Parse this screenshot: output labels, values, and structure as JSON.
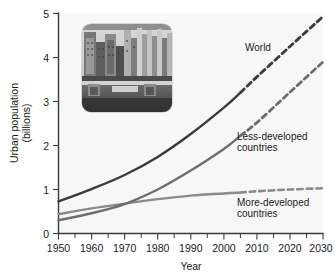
{
  "chart_data": {
    "type": "line",
    "title": "",
    "xlabel": "Year",
    "ylabel": "Urban population (billions)",
    "ylabel_line1": "Urban population",
    "ylabel_line2": "(billions)",
    "xlim": [
      1950,
      2030
    ],
    "ylim": [
      0,
      5
    ],
    "xticks": [
      1950,
      1960,
      1970,
      1980,
      1990,
      2000,
      2010,
      2020,
      2030
    ],
    "xtick_labels": [
      "1950",
      "1960",
      "1970",
      "1980",
      "1990",
      "2000",
      "2010",
      "2020",
      "2030"
    ],
    "xminor_step": 5,
    "yticks": [
      0,
      1,
      2,
      3,
      4,
      5
    ],
    "ytick_labels": [
      "0",
      "1",
      "2",
      "3",
      "4",
      "5"
    ],
    "grid": false,
    "legend_position": "inline-annotations",
    "projection_start_year": 2005,
    "series": [
      {
        "name": "World",
        "label": "World",
        "color": "#3b3b3b",
        "x": [
          1950,
          1960,
          1970,
          1980,
          1990,
          2000,
          2005,
          2010,
          2020,
          2030
        ],
        "values": [
          0.73,
          1.01,
          1.33,
          1.74,
          2.26,
          2.86,
          3.2,
          3.56,
          4.25,
          4.93
        ]
      },
      {
        "name": "Less-developed countries",
        "label_line1": "Less-developed",
        "label_line2": "countries",
        "color": "#6e6e6e",
        "x": [
          1950,
          1960,
          1970,
          1980,
          1990,
          2000,
          2005,
          2010,
          2020,
          2030
        ],
        "values": [
          0.3,
          0.46,
          0.67,
          1.0,
          1.43,
          1.92,
          2.22,
          2.52,
          3.21,
          3.9
        ]
      },
      {
        "name": "More-developed countries",
        "label_line1": "More-developed",
        "label_line2": "countries",
        "color": "#8a8a8a",
        "x": [
          1950,
          1960,
          1970,
          1980,
          1990,
          2000,
          2005,
          2010,
          2020,
          2030
        ],
        "values": [
          0.44,
          0.57,
          0.68,
          0.78,
          0.86,
          0.91,
          0.93,
          0.96,
          1.0,
          1.03
        ]
      }
    ],
    "annotations": [
      {
        "text": "World",
        "x": 2008,
        "y": 4.05
      },
      {
        "text": "Less-developed countries",
        "x": 2008,
        "y": 2.1
      },
      {
        "text": "More-developed countries",
        "x": 2008,
        "y": 0.62
      }
    ]
  },
  "inset": {
    "name": "city-skyline-photo",
    "description": "Grayscale photograph of a dense urban skyline with high-rise buildings and a waterfront"
  },
  "colors": {
    "world": "#3b3b3b",
    "less_developed": "#6e6e6e",
    "more_developed": "#8a8a8a",
    "axis": "#3a3a3a",
    "plot_background": "#f7f7f7",
    "page_background": "#ffffff"
  }
}
